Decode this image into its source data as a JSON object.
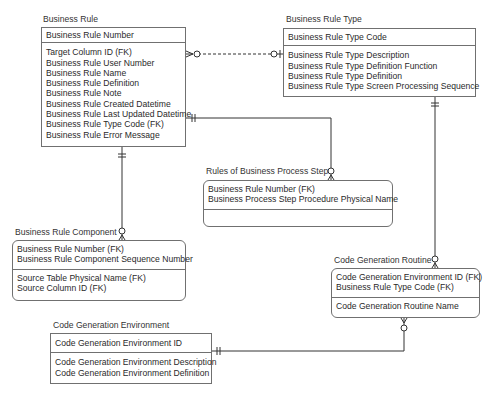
{
  "diagram": {
    "type": "entity-relationship (IDEF1X/crow's foot)",
    "entities": [
      {
        "id": "business_rule",
        "title": "Business Rule",
        "keys": [
          "Business Rule Number"
        ],
        "attributes": [
          "Target Column ID (FK)",
          "Business Rule User Number",
          "Business Rule Name",
          "Business Rule Definition",
          "Business Rule Note",
          "Business Rule Created Datetime",
          "Business Rule Last Updated Datetime",
          "Business Rule Type Code (FK)",
          "Business Rule Error Message"
        ]
      },
      {
        "id": "business_rule_type",
        "title": "Business Rule Type",
        "keys": [
          "Business Rule Type Code"
        ],
        "attributes": [
          "Business Rule Type Description",
          "Business Rule Type Definition Function",
          "Business Rule Type Definition",
          "Business Rule Type Screen Processing Sequence"
        ]
      },
      {
        "id": "rules_of_bps",
        "title": "Rules of Business Process Step",
        "keys": [
          "Business Rule Number (FK)",
          "Business Process Step Procedure Physical Name"
        ],
        "attributes": []
      },
      {
        "id": "business_rule_component",
        "title": "Business Rule Component",
        "keys": [
          "Business Rule Number (FK)",
          "Business Rule Component Sequence Number"
        ],
        "attributes": [
          "Source Table Physical Name (FK)",
          "Source Column ID (FK)"
        ]
      },
      {
        "id": "code_generation_routine",
        "title": "Code Generation Routine",
        "keys": [
          "Code Generation Environment ID (FK)",
          "Business Rule Type Code (FK)"
        ],
        "attributes": [
          "Code Generation Routine Name"
        ]
      },
      {
        "id": "code_generation_environment",
        "title": "Code Generation Environment",
        "keys": [
          "Code Generation Environment ID"
        ],
        "attributes": [
          "Code Generation Environment Description",
          "Code Generation Environment Definition"
        ]
      }
    ],
    "relationships": [
      {
        "from": "Business Rule Type",
        "to": "Business Rule",
        "style": "dashed",
        "from_end": "zero-or-one",
        "to_end": "zero-or-many"
      },
      {
        "from": "Business Rule",
        "to": "Rules of Business Process Step",
        "style": "solid",
        "from_end": "exactly-one",
        "to_end": "zero-or-many"
      },
      {
        "from": "Business Rule",
        "to": "Business Rule Component",
        "style": "solid",
        "from_end": "exactly-one",
        "to_end": "zero-or-many"
      },
      {
        "from": "Business Rule Type",
        "to": "Code Generation Routine",
        "style": "solid",
        "from_end": "exactly-one",
        "to_end": "zero-or-many"
      },
      {
        "from": "Code Generation Environment",
        "to": "Code Generation Routine",
        "style": "solid",
        "from_end": "exactly-one",
        "to_end": "zero-or-many"
      }
    ]
  }
}
